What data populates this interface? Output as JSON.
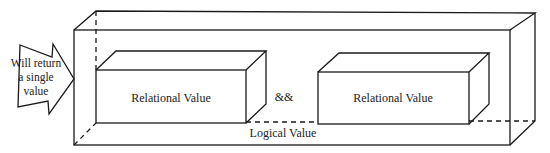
{
  "diagram": {
    "arrow_label_lines": [
      "Will return",
      "a single",
      "value"
    ],
    "outer_box_label": "Logical Value",
    "left_box_label": "Relational Value",
    "operator": "&&",
    "right_box_label": "Relational Value"
  },
  "colors": {
    "stroke": "#1a1a1a",
    "text": "#222222",
    "background": "#ffffff"
  }
}
